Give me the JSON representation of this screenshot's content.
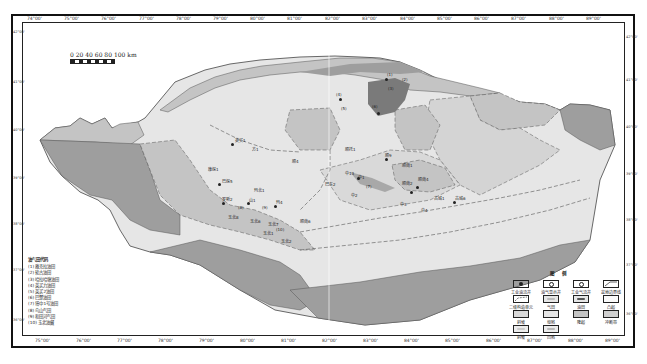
{
  "map": {
    "scale_label": "0  20  40  60  80 100 km",
    "longitude_ticks_top": [
      "74°00'",
      "75°00'",
      "76°00'",
      "77°00'",
      "78°00'",
      "79°00'",
      "80°00'",
      "81°00'",
      "82°00'",
      "83°00'",
      "84°00'",
      "85°00'",
      "86°00'",
      "87°00'",
      "88°00'",
      "89°00'"
    ],
    "longitude_ticks_bottom": [
      "75°00'",
      "76°00'",
      "77°00'",
      "78°00'",
      "79°00'",
      "80°00'",
      "81°00'",
      "82°00'",
      "83°00'",
      "84°00'",
      "85°00'",
      "86°00'",
      "87°00'",
      "88°00'",
      "89°00'"
    ],
    "latitude_ticks_left": [
      "42°00'",
      "41°00'",
      "40°00'",
      "39°00'",
      "38°00'",
      "37°00'",
      "36°00'"
    ],
    "latitude_ticks_right": [
      "42°00'",
      "41°00'",
      "40°00'",
      "39°00'",
      "38°00'",
      "37°00'",
      "36°00'"
    ],
    "colors": {
      "light": "#e6e6e6",
      "medium": "#c4c4c4",
      "dark": "#9e9e9e",
      "darkest": "#7a7a7a",
      "boundary": "#555555"
    }
  },
  "field_codes": {
    "title": "油气田代码",
    "items": [
      "(1) 雅克拉油田",
      "(2) 轮古油田",
      "(3) 哈拉哈塘油田",
      "(4) 英买力油田",
      "(5) 英买2油田",
      "(6) 巴楚油田",
      "(7) 塔中1号油田",
      "(8) 鸟山气田",
      "(9) 和田河气田",
      "(10) 玉北油藏"
    ]
  },
  "legend": {
    "title": "图 例",
    "items": [
      {
        "label": "工业油流井",
        "icon": "oil-well-icon"
      },
      {
        "label": "油气显示井",
        "icon": "show-well-icon"
      },
      {
        "label": "工业气流井",
        "icon": "gas-well-icon"
      },
      {
        "label": "盆地边界线",
        "icon": "basin-boundary-icon"
      },
      {
        "label": "二级构造单元",
        "icon": "secondary-unit-icon"
      },
      {
        "label": "气田",
        "icon": "gas-field-icon"
      },
      {
        "label": "油田",
        "icon": "oil-field-icon"
      },
      {
        "label": "凸起",
        "icon": "uplift-icon"
      },
      {
        "label": "斜坡",
        "icon": "slope-icon"
      },
      {
        "label": "坳陷",
        "icon": "depression-icon"
      },
      {
        "label": "隆起",
        "icon": "rise-icon"
      },
      {
        "label": "冲断带",
        "icon": "thrust-belt-icon"
      },
      {
        "label": "斜坡",
        "icon": "slope2-icon"
      },
      {
        "label": "凹陷",
        "icon": "sag-icon"
      }
    ]
  },
  "places": [
    {
      "label": "英买1",
      "x": 235,
      "y": 137
    },
    {
      "label": "方1",
      "x": 252,
      "y": 146
    },
    {
      "label": "康探1",
      "x": 208,
      "y": 166
    },
    {
      "label": "巴探5",
      "x": 222,
      "y": 178
    },
    {
      "label": "玛北1",
      "x": 254,
      "y": 187
    },
    {
      "label": "罗斯2",
      "x": 222,
      "y": 196
    },
    {
      "label": "山1",
      "x": 249,
      "y": 197
    },
    {
      "label": "(8)",
      "x": 238,
      "y": 205
    },
    {
      "label": "(9)",
      "x": 262,
      "y": 205
    },
    {
      "label": "玛4",
      "x": 276,
      "y": 199
    },
    {
      "label": "玉北8",
      "x": 228,
      "y": 214
    },
    {
      "label": "玉北6",
      "x": 250,
      "y": 218
    },
    {
      "label": "玉北7",
      "x": 268,
      "y": 221
    },
    {
      "label": "玉北1",
      "x": 269,
      "y": 230
    },
    {
      "label": "(10)",
      "x": 278,
      "y": 229
    },
    {
      "label": "玉北2",
      "x": 281,
      "y": 238
    },
    {
      "label": "顺4",
      "x": 292,
      "y": 158
    },
    {
      "label": "巴东2",
      "x": 325,
      "y": 181
    },
    {
      "label": "中13",
      "x": 347,
      "y": 171
    },
    {
      "label": "中1",
      "x": 360,
      "y": 174
    },
    {
      "label": "(7)",
      "x": 366,
      "y": 184
    },
    {
      "label": "中2",
      "x": 353,
      "y": 192
    },
    {
      "label": "顺托1",
      "x": 346,
      "y": 146
    },
    {
      "label": "顺9",
      "x": 385,
      "y": 152
    },
    {
      "label": "顺南1",
      "x": 402,
      "y": 167
    },
    {
      "label": "顺南5",
      "x": 404,
      "y": 169
    },
    {
      "label": "顺南4",
      "x": 418,
      "y": 182
    },
    {
      "label": "顺南2",
      "x": 404,
      "y": 185
    },
    {
      "label": "顺南6",
      "x": 313,
      "y": 223
    },
    {
      "label": "古城1",
      "x": 436,
      "y": 197
    },
    {
      "label": "古城6",
      "x": 458,
      "y": 197
    },
    {
      "label": "中3",
      "x": 400,
      "y": 201
    },
    {
      "label": "中4",
      "x": 421,
      "y": 207
    },
    {
      "label": "(4)",
      "x": 338,
      "y": 93
    },
    {
      "label": "(5)",
      "x": 343,
      "y": 107
    },
    {
      "label": "(1)",
      "x": 387,
      "y": 75
    },
    {
      "label": "(2)",
      "x": 400,
      "y": 79
    },
    {
      "label": "(3)",
      "x": 392,
      "y": 86
    },
    {
      "label": "(6)",
      "x": 373,
      "y": 106
    }
  ]
}
